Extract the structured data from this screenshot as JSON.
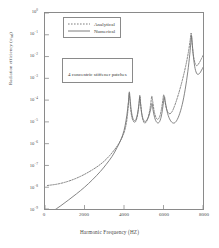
{
  "chart_data": {
    "type": "line",
    "title": "",
    "xlabel": "Harmonic Frequency (HZ)",
    "ylabel": "Radiation efficiency (σrad)",
    "ylabel_main": "Radiation efficiency (",
    "ylabel_sub": "rad",
    "ylabel_sym": "σ",
    "ylabel_tail": ")",
    "xlim": [
      0,
      8000
    ],
    "ylim_exp": [
      -9,
      0
    ],
    "yscale": "log",
    "xscale": "linear",
    "grid": false,
    "legend_position": "top-inside",
    "xticks": [
      0,
      2000,
      4000,
      6000,
      8000
    ],
    "xtick_labels": [
      "0",
      "2000",
      "4000",
      "6000",
      "8000"
    ],
    "ytick_exponents": [
      0,
      -1,
      -2,
      -3,
      -4,
      -5,
      -6,
      -7,
      -8,
      -9
    ],
    "ytick_labels": [
      "10⁰",
      "10⁻¹",
      "10⁻²",
      "10⁻³",
      "10⁻⁴",
      "10⁻⁵",
      "10⁻⁶",
      "10⁻⁷",
      "10⁻⁸",
      "10⁻⁹"
    ],
    "ymantissa": "10",
    "annotations": [
      {
        "text": "4 concentric stiffener patches",
        "x": 2600,
        "y_exp": -1.9
      }
    ],
    "series": [
      {
        "name": "Analytical",
        "style": "dotted",
        "color": "#6f6f6f",
        "points": [
          [
            120,
            -7.92
          ],
          [
            300,
            -7.9
          ],
          [
            600,
            -7.86
          ],
          [
            900,
            -7.8
          ],
          [
            1200,
            -7.72
          ],
          [
            1500,
            -7.62
          ],
          [
            1800,
            -7.5
          ],
          [
            2100,
            -7.36
          ],
          [
            2400,
            -7.2
          ],
          [
            2700,
            -7.02
          ],
          [
            3000,
            -6.8
          ],
          [
            3300,
            -6.52
          ],
          [
            3600,
            -6.18
          ],
          [
            3800,
            -5.9
          ],
          [
            3950,
            -5.62
          ],
          [
            4050,
            -5.35
          ],
          [
            4130,
            -5.0
          ],
          [
            4190,
            -4.55
          ],
          [
            4230,
            -4.05
          ],
          [
            4260,
            -3.7
          ],
          [
            4290,
            -3.9
          ],
          [
            4330,
            -4.35
          ],
          [
            4390,
            -4.75
          ],
          [
            4460,
            -4.95
          ],
          [
            4540,
            -5.02
          ],
          [
            4620,
            -4.92
          ],
          [
            4700,
            -4.62
          ],
          [
            4760,
            -4.2
          ],
          [
            4800,
            -3.78
          ],
          [
            4840,
            -4.12
          ],
          [
            4890,
            -4.58
          ],
          [
            4960,
            -4.92
          ],
          [
            5040,
            -5.05
          ],
          [
            5130,
            -5.0
          ],
          [
            5220,
            -4.8
          ],
          [
            5300,
            -4.48
          ],
          [
            5360,
            -4.12
          ],
          [
            5410,
            -3.82
          ],
          [
            5460,
            -4.1
          ],
          [
            5530,
            -4.52
          ],
          [
            5620,
            -4.8
          ],
          [
            5720,
            -4.88
          ],
          [
            5820,
            -4.72
          ],
          [
            5900,
            -4.4
          ],
          [
            5960,
            -4.05
          ],
          [
            6010,
            -3.76
          ],
          [
            6070,
            -4.05
          ],
          [
            6160,
            -4.42
          ],
          [
            6280,
            -4.62
          ],
          [
            6420,
            -4.55
          ],
          [
            6580,
            -4.22
          ],
          [
            6760,
            -3.72
          ],
          [
            6950,
            -3.1
          ],
          [
            7120,
            -2.45
          ],
          [
            7260,
            -1.8
          ],
          [
            7350,
            -1.25
          ],
          [
            7400,
            -0.92
          ],
          [
            7440,
            -1.3
          ],
          [
            7500,
            -1.85
          ],
          [
            7580,
            -2.25
          ],
          [
            7680,
            -2.42
          ],
          [
            7800,
            -2.3
          ],
          [
            7920,
            -2.1
          ],
          [
            8000,
            -1.95
          ]
        ]
      },
      {
        "name": "Numerical",
        "style": "solid",
        "color": "#6f6f6f",
        "points": [
          [
            120,
            -9.3
          ],
          [
            400,
            -9.1
          ],
          [
            800,
            -8.85
          ],
          [
            1200,
            -8.58
          ],
          [
            1600,
            -8.3
          ],
          [
            2000,
            -8.0
          ],
          [
            2400,
            -7.66
          ],
          [
            2800,
            -7.28
          ],
          [
            3100,
            -6.95
          ],
          [
            3400,
            -6.58
          ],
          [
            3650,
            -6.18
          ],
          [
            3850,
            -5.8
          ],
          [
            4000,
            -5.4
          ],
          [
            4100,
            -4.95
          ],
          [
            4180,
            -4.45
          ],
          [
            4240,
            -3.95
          ],
          [
            4270,
            -3.62
          ],
          [
            4310,
            -3.95
          ],
          [
            4360,
            -4.42
          ],
          [
            4430,
            -4.78
          ],
          [
            4520,
            -4.95
          ],
          [
            4610,
            -4.88
          ],
          [
            4690,
            -4.6
          ],
          [
            4750,
            -4.22
          ],
          [
            4800,
            -3.86
          ],
          [
            4840,
            -4.2
          ],
          [
            4900,
            -4.62
          ],
          [
            4980,
            -4.9
          ],
          [
            5070,
            -4.98
          ],
          [
            5170,
            -4.9
          ],
          [
            5270,
            -4.7
          ],
          [
            5350,
            -4.42
          ],
          [
            5420,
            -4.15
          ],
          [
            5470,
            -4.45
          ],
          [
            5550,
            -4.8
          ],
          [
            5660,
            -5.02
          ],
          [
            5780,
            -5.02
          ],
          [
            5880,
            -4.78
          ],
          [
            5950,
            -4.42
          ],
          [
            6000,
            -4.08
          ],
          [
            6050,
            -3.85
          ],
          [
            6110,
            -4.18
          ],
          [
            6210,
            -4.62
          ],
          [
            6340,
            -4.92
          ],
          [
            6480,
            -5.05
          ],
          [
            6620,
            -5.0
          ],
          [
            6780,
            -4.72
          ],
          [
            6950,
            -4.2
          ],
          [
            7100,
            -3.5
          ],
          [
            7230,
            -2.7
          ],
          [
            7330,
            -1.9
          ],
          [
            7390,
            -1.3
          ],
          [
            7420,
            -1.05
          ],
          [
            7460,
            -1.45
          ],
          [
            7520,
            -2.05
          ],
          [
            7600,
            -2.55
          ],
          [
            7700,
            -2.8
          ],
          [
            7820,
            -2.78
          ],
          [
            7930,
            -2.62
          ],
          [
            8000,
            -2.5
          ]
        ]
      }
    ]
  },
  "legend": {
    "items": [
      {
        "label": "Analytical",
        "style": "dotted"
      },
      {
        "label": "Numerical",
        "style": "solid"
      }
    ]
  },
  "annotation": {
    "text": "4 concentric stiffener patches"
  },
  "axes": {
    "x_title": "Harmonic Frequency (HZ)",
    "y_title_main": "Radiation efficiency (",
    "y_title_sym": "σ",
    "y_title_sub": "rad",
    "y_title_tail": ")"
  },
  "colors": {
    "frame": "#8a8a8a",
    "curve": "#6f6f6f",
    "text": "#3a3a3a",
    "background": "#ffffff"
  }
}
